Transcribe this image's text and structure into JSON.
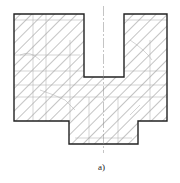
{
  "figure": {
    "caption": "a)",
    "colors": {
      "outline": "#222222",
      "hatch": "#555555",
      "hidden": "#aaaaaa",
      "background": "#ffffff"
    }
  }
}
